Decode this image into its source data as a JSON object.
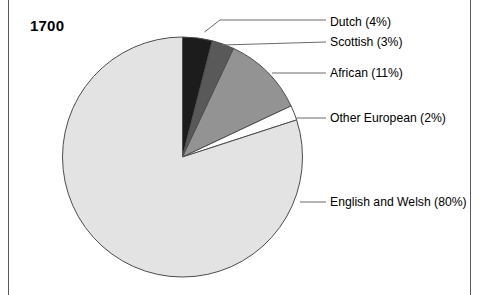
{
  "figure": {
    "title": "1700",
    "frame_color": "#5b5b5b",
    "background": "#ffffff"
  },
  "chart_data": {
    "type": "pie",
    "title": "1700",
    "xlabel": "",
    "ylabel": "",
    "legend_position": "callout-labels-right",
    "grid": false,
    "start_angle_deg": 0,
    "direction": "clockwise",
    "categories": [
      "Dutch",
      "Scottish",
      "African",
      "Other European",
      "English and Welsh"
    ],
    "values": [
      4,
      3,
      11,
      2,
      80
    ],
    "unit": "percent",
    "labels": [
      "Dutch (4%)",
      "Scottish (3%)",
      "African (11%)",
      "Other European (2%)",
      "English and Welsh (80%)"
    ],
    "slice_colors": [
      "#1c1c1c",
      "#595959",
      "#939393",
      "#ffffff",
      "#e3e3e3"
    ],
    "slice_outline_color": "#4d4d4d"
  },
  "pie": {
    "center_x": 182.5,
    "center_y": 157,
    "radius": 120,
    "slices": [
      {
        "name": "Dutch",
        "label": "Dutch (4%)",
        "value": 4,
        "color": "#1c1c1c",
        "label_x": 330,
        "label_y": 22,
        "leader": "M 204.5 32 L 220 20 L 326 20"
      },
      {
        "name": "Scottish",
        "label": "Scottish (3%)",
        "value": 3,
        "color": "#595959",
        "label_x": 330,
        "label_y": 42,
        "leader": "M 222 45 L 326 42"
      },
      {
        "name": "African",
        "label": "African (11%)",
        "value": 11,
        "color": "#939393",
        "label_x": 330,
        "label_y": 73,
        "leader": "M 272 73 L 326 73"
      },
      {
        "name": "Other European",
        "label": "Other European (2%)",
        "value": 2,
        "color": "#ffffff",
        "label_x": 330,
        "label_y": 118,
        "leader": "M 296 118 L 326 118"
      },
      {
        "name": "English and Welsh",
        "label": "English and Welsh (80%)",
        "value": 80,
        "color": "#e3e3e3",
        "label_x": 330,
        "label_y": 202,
        "leader": "M 300 202 L 326 202"
      }
    ]
  }
}
